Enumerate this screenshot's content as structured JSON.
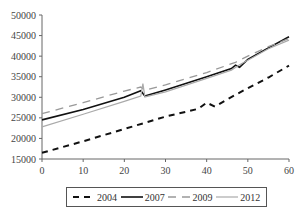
{
  "chart_data": {
    "type": "line",
    "title": "",
    "xlabel": "",
    "ylabel": "",
    "xlim": [
      0,
      60
    ],
    "ylim": [
      15000,
      50000
    ],
    "x_ticks": [
      0,
      10,
      20,
      30,
      40,
      50,
      60
    ],
    "y_ticks": [
      15000,
      20000,
      25000,
      30000,
      35000,
      40000,
      45000,
      50000
    ],
    "grid": false,
    "legend_position": "bottom",
    "series": [
      {
        "name": "2004",
        "style": "dashed",
        "color": "#111111",
        "width": 2,
        "dash": "6,5",
        "points": [
          [
            0,
            16500
          ],
          [
            10,
            19300
          ],
          [
            20,
            22300
          ],
          [
            30,
            25300
          ],
          [
            38,
            27200
          ],
          [
            40,
            28700
          ],
          [
            42,
            27700
          ],
          [
            45,
            29500
          ],
          [
            50,
            32200
          ],
          [
            55,
            34800
          ],
          [
            60,
            37700
          ]
        ]
      },
      {
        "name": "2007",
        "style": "solid",
        "color": "#111111",
        "width": 1.6,
        "dash": "",
        "points": [
          [
            0,
            24500
          ],
          [
            10,
            27000
          ],
          [
            20,
            30000
          ],
          [
            24,
            31600
          ],
          [
            25,
            30300
          ],
          [
            30,
            31800
          ],
          [
            40,
            35000
          ],
          [
            46,
            37000
          ],
          [
            47,
            37800
          ],
          [
            48,
            37300
          ],
          [
            50,
            39200
          ],
          [
            55,
            42000
          ],
          [
            60,
            44700
          ]
        ]
      },
      {
        "name": "2009",
        "style": "dashed",
        "color": "#999999",
        "width": 1.3,
        "dash": "8,6",
        "points": [
          [
            0,
            26000
          ],
          [
            10,
            28700
          ],
          [
            20,
            31500
          ],
          [
            24,
            32500
          ],
          [
            25,
            31700
          ],
          [
            30,
            33000
          ],
          [
            40,
            36000
          ],
          [
            47,
            38500
          ],
          [
            50,
            40000
          ],
          [
            55,
            42300
          ],
          [
            60,
            44300
          ]
        ]
      },
      {
        "name": "2012",
        "style": "solid",
        "color": "#aaaaaa",
        "width": 1.2,
        "dash": "",
        "points": [
          [
            0,
            22800
          ],
          [
            10,
            25900
          ],
          [
            20,
            29000
          ],
          [
            24,
            30300
          ],
          [
            24.5,
            33300
          ],
          [
            25,
            30100
          ],
          [
            30,
            31300
          ],
          [
            40,
            34600
          ],
          [
            46,
            36600
          ],
          [
            48,
            37900
          ],
          [
            50,
            39000
          ],
          [
            55,
            41800
          ],
          [
            60,
            43900
          ]
        ]
      }
    ]
  }
}
